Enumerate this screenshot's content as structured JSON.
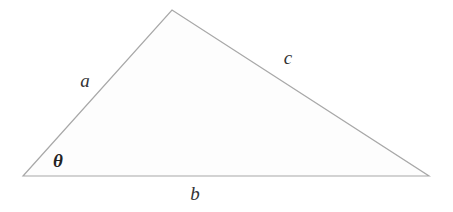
{
  "figure": {
    "type": "geometry-diagram",
    "shape_name": "triangle",
    "background_color": "#ffffff",
    "stroke_color": "#a8a8a8",
    "fill_color": "#fdfdfd",
    "stroke_width": 1.2,
    "label_color": "#333333",
    "angle_label_color": "#232323",
    "vertices": [
      {
        "name": "left-vertex",
        "x": 23,
        "y": 176
      },
      {
        "name": "apex-vertex",
        "x": 172,
        "y": 10
      },
      {
        "name": "right-vertex",
        "x": 429,
        "y": 176
      }
    ],
    "polygon_points": "23,176 172,10 429,176",
    "sides": [
      {
        "id": "a",
        "label": "a",
        "from": "left-vertex",
        "to": "apex-vertex",
        "label_x": 85,
        "label_y": 80
      },
      {
        "id": "c",
        "label": "c",
        "from": "apex-vertex",
        "to": "right-vertex",
        "label_x": 288,
        "label_y": 57
      },
      {
        "id": "b",
        "label": "b",
        "from": "left-vertex",
        "to": "right-vertex",
        "label_x": 195,
        "label_y": 193
      }
    ],
    "angles": [
      {
        "id": "theta",
        "label": "θ",
        "at_vertex": "left-vertex",
        "label_x": 58,
        "label_y": 160
      }
    ]
  }
}
